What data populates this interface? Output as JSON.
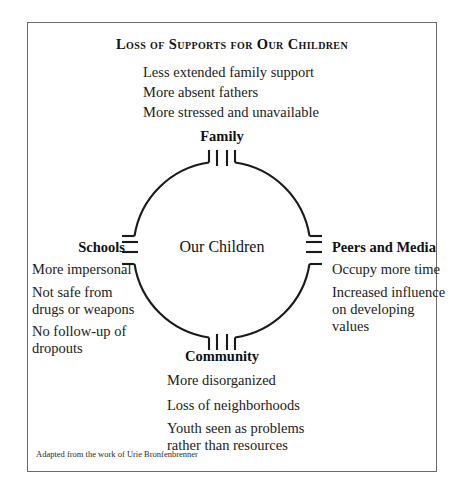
{
  "figure": {
    "title": "Loss of Supports for Our Children",
    "center_label": "Our Children",
    "credit": "Adapted from the work of Urie Bronfenbrenner",
    "colors": {
      "ink": "#1a1a1a",
      "frame": "#6b6b6b",
      "background": "#ffffff"
    }
  },
  "nodes": {
    "top": {
      "label": "Family",
      "items": [
        "Less extended family support",
        "More absent fathers",
        "More stressed and unavailable"
      ]
    },
    "left": {
      "label": "Schools",
      "items": [
        "More impersonal",
        "Not safe from",
        "drugs or weapons",
        "No follow-up of",
        "dropouts"
      ]
    },
    "right": {
      "label": "Peers and Media",
      "items": [
        "Occupy more time",
        "Increased influence",
        "on developing",
        "values"
      ]
    },
    "bottom": {
      "label": "Community",
      "items": [
        "More disorganized",
        "Loss of neighborhoods",
        "Youth seen as problems",
        "rather than resources"
      ]
    }
  }
}
